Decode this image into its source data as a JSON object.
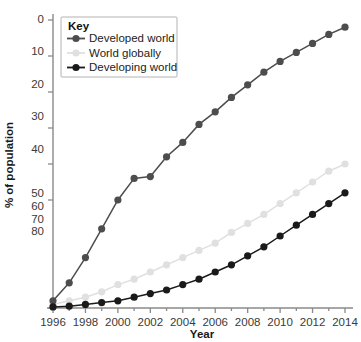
{
  "chart_data": {
    "type": "line",
    "title": "",
    "xlabel": "Year",
    "ylabel": "% of population",
    "xlim": [
      1996,
      2014
    ],
    "ylim": [
      0,
      80
    ],
    "xticks": [
      1996,
      1998,
      2000,
      2002,
      2004,
      2006,
      2008,
      2010,
      2012,
      2014
    ],
    "yticks": [
      0,
      10,
      20,
      30,
      40,
      50,
      60,
      70,
      80
    ],
    "grid": false,
    "legend_position": "top-left",
    "legend_title": "Key",
    "x": [
      1996,
      1997,
      1998,
      1999,
      2000,
      2001,
      2002,
      2003,
      2004,
      2005,
      2006,
      2007,
      2008,
      2009,
      2010,
      2011,
      2012,
      2013,
      2014
    ],
    "series": [
      {
        "name": "Developed world",
        "color": "#4d4d4d",
        "values": [
          2,
          7,
          14,
          22,
          30,
          36,
          36.5,
          42,
          46,
          51,
          54.5,
          58.5,
          62,
          65.5,
          68.5,
          71,
          73.5,
          76,
          78
        ]
      },
      {
        "name": "World globally",
        "color": "#e0e0e0",
        "values": [
          1,
          2,
          3,
          4.5,
          6.5,
          8,
          10,
          12,
          14,
          16,
          18,
          21,
          23.5,
          26,
          29,
          32,
          35,
          38,
          40
        ]
      },
      {
        "name": "Developing world",
        "color": "#1a1a1a",
        "values": [
          0.3,
          0.5,
          1,
          1.5,
          2,
          3,
          4,
          5,
          6.5,
          8,
          10,
          12,
          14.5,
          17,
          20,
          23,
          26,
          29,
          32
        ]
      }
    ]
  },
  "axis": {
    "y_tick_labels": [
      "80",
      "70",
      "60",
      "50",
      "40",
      "30",
      "20",
      "10",
      "0"
    ],
    "x_tick_labels": [
      "1996",
      "1998",
      "2000",
      "2002",
      "2004",
      "2006",
      "2008",
      "2010",
      "2012",
      "2014"
    ],
    "x_title": "Year",
    "y_title": "% of population"
  },
  "legend": {
    "title": "Key",
    "items": [
      {
        "label": "Developed world",
        "color": "#4d4d4d"
      },
      {
        "label": "World globally",
        "color": "#e0e0e0"
      },
      {
        "label": "Developing world",
        "color": "#1a1a1a"
      }
    ]
  }
}
